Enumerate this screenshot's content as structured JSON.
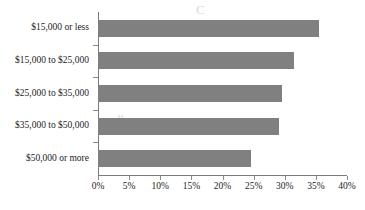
{
  "chart_data": {
    "type": "bar",
    "orientation": "horizontal",
    "title": "",
    "xlabel": "",
    "ylabel": "",
    "categories": [
      "$15,000 or less",
      "$15,000 to $25,000",
      "$25,000 to $35,000",
      "$35,000 to $50,000",
      "$50,000 or more"
    ],
    "values": [
      35.5,
      31.5,
      29.5,
      29.0,
      24.5
    ],
    "value_suffix": "%",
    "xlim": [
      0,
      40
    ],
    "xticks": [
      0,
      5,
      10,
      15,
      20,
      25,
      30,
      35,
      40
    ],
    "xticklabels": [
      "0%",
      "5%",
      "10%",
      "15%",
      "20%",
      "25%",
      "30%",
      "35%",
      "40%"
    ],
    "grid": false,
    "legend": null,
    "series": [
      {
        "name": "",
        "values": [
          35.5,
          31.5,
          29.5,
          29.0,
          24.5
        ]
      }
    ]
  },
  "style": {
    "bar_color": "#808080",
    "axis_color": "#7a7a7a",
    "text_color": "#1d1d1d",
    "background": "#ffffff",
    "ghost_color": "#dedad6"
  },
  "ghost_text": {
    "line1": "C",
    "line2": "DELLL",
    "line3": "ew A Count",
    "line4": "u ,"
  }
}
